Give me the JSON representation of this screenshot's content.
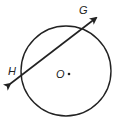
{
  "diagram": {
    "type": "circle-secant",
    "circle": {
      "center_label": "O",
      "cx": 66,
      "cy": 71,
      "r": 45
    },
    "line": {
      "from": [
        8,
        85
      ],
      "to": [
        98,
        17
      ],
      "arrows": "both"
    },
    "points": [
      {
        "label": "G",
        "x": 80,
        "y": 14
      },
      {
        "label": "H",
        "x": 9,
        "y": 75
      },
      {
        "label": "O",
        "x": 56,
        "y": 78
      }
    ],
    "colors": {
      "stroke": "#222222",
      "background": "#ffffff"
    }
  }
}
